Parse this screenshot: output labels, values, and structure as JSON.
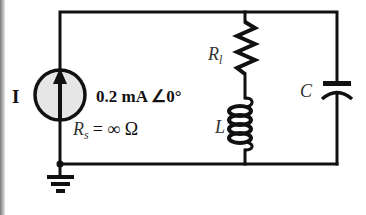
{
  "diagram": {
    "type": "circuit-schematic",
    "source": {
      "label": "I",
      "value": "0.2 mA ∠0°",
      "internal_resistance_label": "R",
      "internal_resistance_subscript": "s",
      "internal_resistance_value": "= ∞ Ω",
      "fill_color": "#e6e6e6"
    },
    "components": {
      "resistor": {
        "label": "R",
        "subscript": "l"
      },
      "inductor": {
        "label": "L"
      },
      "capacitor": {
        "label": "C"
      }
    },
    "colors": {
      "wire": "#111111",
      "background": "#ffffff"
    }
  }
}
